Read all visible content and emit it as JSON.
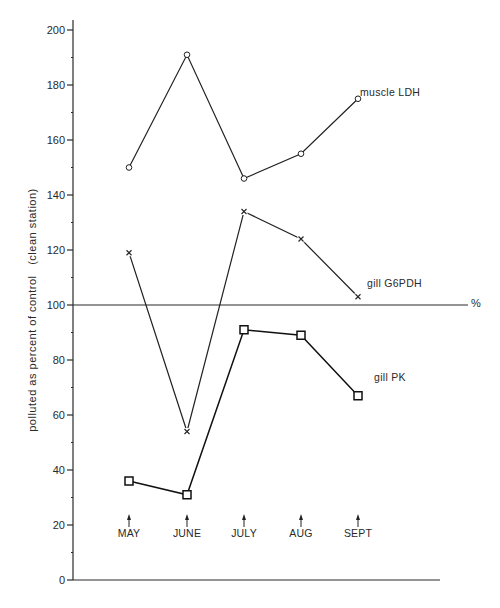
{
  "chart_data": {
    "type": "line",
    "title": "",
    "xlabel": "",
    "ylabel": "polluted as percent of control   (clean station)",
    "ylim": [
      0,
      200
    ],
    "yticks": [
      0,
      20,
      40,
      60,
      80,
      100,
      120,
      140,
      160,
      180,
      200
    ],
    "yminor_step": 10,
    "grid": false,
    "reference_line": {
      "y": 100,
      "label": "%"
    },
    "categories": [
      "MAY",
      "JUNE",
      "JULY",
      "AUG",
      "SEPT"
    ],
    "series": [
      {
        "name": "muscle LDH",
        "marker": "circle",
        "values": [
          150,
          191,
          146,
          155,
          175
        ]
      },
      {
        "name": "gill G6PDH",
        "marker": "x",
        "values": [
          119,
          54,
          134,
          124,
          103
        ]
      },
      {
        "name": "gill PK",
        "marker": "square",
        "values": [
          36,
          31,
          91,
          89,
          67
        ]
      }
    ],
    "legend_position": "inline labels at right end of each series",
    "month_markers": "upward arrows above month labels"
  },
  "layout": {
    "axis_x": 73,
    "y0_px": 580,
    "px_per_unit": 2.75,
    "x_axis_end": 440,
    "ref_line_end": 468,
    "category_x": [
      129,
      187,
      244,
      301,
      358
    ]
  },
  "labels": {
    "muscle_ldh": "muscle LDH",
    "gill_g6pdh": "gill G6PDH",
    "gill_pk": "gill PK",
    "percent": "%",
    "y_axis_title": "polluted as percent of control   (clean station)"
  }
}
